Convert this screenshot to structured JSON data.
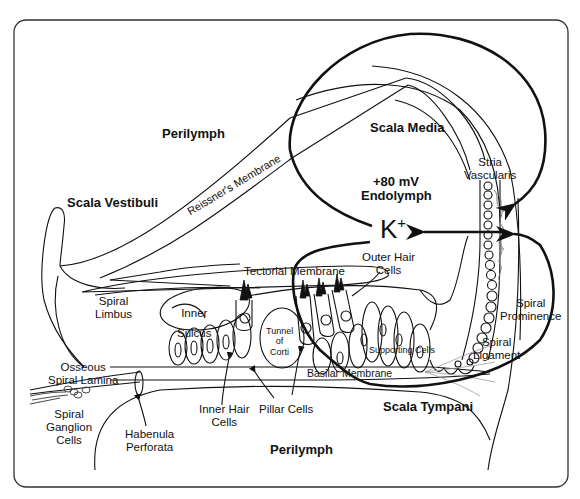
{
  "diagram": {
    "compartments": {
      "scala_vestibuli": "Scala Vestibuli",
      "scala_media": "Scala Media",
      "scala_tympani": "Scala Tympani",
      "perilymph_top": "Perilymph",
      "perilymph_bottom": "Perilymph",
      "endolymph_potential": "+80 mV",
      "endolymph": "Endolymph"
    },
    "ion": {
      "symbol": "K",
      "charge": "+"
    },
    "structures": {
      "reissners_membrane": "Reissner's Membrane",
      "stria_vascularis_1": "Stria",
      "stria_vascularis_2": "Vascularis",
      "tectorial_membrane": "Tectorial Membrane",
      "outer_hair_cells_1": "Outer Hair",
      "outer_hair_cells_2": "Cells",
      "spiral_limbus_1": "Spiral",
      "spiral_limbus_2": "Limbus",
      "inner_sulcus_1": "Inner",
      "inner_sulcus_2": "Sulcus",
      "tunnel_of_corti_1": "Tunnel",
      "tunnel_of_corti_2": "of",
      "tunnel_of_corti_3": "Corti",
      "spiral_prominence_1": "Spiral",
      "spiral_prominence_2": "Prominence",
      "supporting_cells": "Supporting Cells",
      "spiral_ligament_1": "Spiral",
      "spiral_ligament_2": "Ligament",
      "osseous_spiral_lamina_1": "Osseous",
      "osseous_spiral_lamina_2": "Spiral Lamina",
      "basilar_membrane": "Basilar Membrane",
      "spiral_ganglion_1": "Spiral",
      "spiral_ganglion_2": "Ganglion",
      "spiral_ganglion_3": "Cells",
      "habenula_perforata_1": "Habenula",
      "habenula_perforata_2": "Perforata",
      "inner_hair_cells_1": "Inner Hair",
      "inner_hair_cells_2": "Cells",
      "pillar_cells": "Pillar Cells"
    },
    "colors": {
      "line": "#111111",
      "stria_fill": "#8a8a8a",
      "ligament_fibers": "#9a9a9a",
      "background": "#ffffff"
    }
  }
}
